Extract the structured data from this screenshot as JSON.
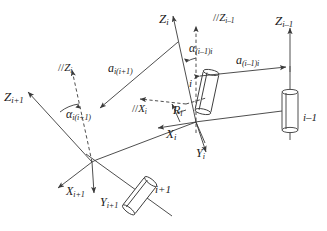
{
  "figure": {
    "kind": "kinematic-link-coordinate-diagram",
    "background_color": "#ffffff",
    "line_color": "#3a3a3a",
    "text_color": "#1a1a1a"
  },
  "axes": [
    {
      "id": "z-i",
      "base": "Z",
      "sub": "i",
      "prefix": "",
      "text": "Zi"
    },
    {
      "id": "z-i-minus-1-parallel",
      "base": "Z",
      "sub": "i-1",
      "prefix": "//",
      "text": "//Zi-1"
    },
    {
      "id": "z-i-minus-1",
      "base": "Z",
      "sub": "i-1",
      "prefix": "",
      "text": "Zi-1"
    },
    {
      "id": "z-i-parallel",
      "base": "Z",
      "sub": "i",
      "prefix": "//",
      "text": "//Zi"
    },
    {
      "id": "z-i-plus-1",
      "base": "Z",
      "sub": "i+1",
      "prefix": "",
      "text": "Zi+1"
    },
    {
      "id": "x-i-parallel",
      "base": "X",
      "sub": "i",
      "prefix": "//",
      "text": "//Xi"
    },
    {
      "id": "x-i",
      "base": "X",
      "sub": "i",
      "prefix": "",
      "text": "Xi"
    },
    {
      "id": "y-i",
      "base": "Y",
      "sub": "i",
      "prefix": "",
      "text": "Yi"
    },
    {
      "id": "x-i-plus-1",
      "base": "X",
      "sub": "i+1",
      "prefix": "",
      "text": "Xi+1"
    },
    {
      "id": "y-i-plus-1",
      "base": "Y",
      "sub": "i+1",
      "prefix": "",
      "text": "Yi+1"
    }
  ],
  "parameters": [
    {
      "id": "alpha-i-minus-1-i",
      "base": "α",
      "sub": "(i-1)i",
      "text": "alpha(i-1)i",
      "meaning": "twist angle between Zi-1 and Zi"
    },
    {
      "id": "alpha-i-i-plus-1",
      "base": "α",
      "sub": "i(i+1)",
      "text": "alpha i(i+1)",
      "meaning": "twist angle between Zi and Zi+1"
    },
    {
      "id": "a-i-minus-1-i",
      "base": "a",
      "sub": "(i-1)i",
      "text": "a(i-1)i",
      "meaning": "link length between Zi-1 and Zi"
    },
    {
      "id": "a-i-i-plus-1",
      "base": "a",
      "sub": "i(i+1)",
      "text": "a i(i+1)",
      "meaning": "link length between Zi and Zi+1"
    },
    {
      "id": "r-i",
      "base": "R",
      "sub": "i",
      "text": "Ri",
      "meaning": "link offset along Zi"
    }
  ],
  "joints": [
    {
      "id": "joint-i-minus-1",
      "label": "i−1",
      "orientation": "vertical"
    },
    {
      "id": "joint-i",
      "label": "i",
      "orientation": "tilted"
    },
    {
      "id": "joint-i-plus-1",
      "label": "i+1",
      "orientation": "tilted"
    }
  ],
  "labels": {
    "z_i": {
      "prefix": "",
      "base": "Z",
      "sub": "i"
    },
    "z_i_minus_1_par": {
      "prefix": "//",
      "base": "Z",
      "sub": "i–1"
    },
    "z_i_minus_1": {
      "prefix": "",
      "base": "Z",
      "sub": "i–1"
    },
    "z_i_par": {
      "prefix": "//",
      "base": "Z",
      "sub": "i"
    },
    "z_i_plus_1": {
      "prefix": "",
      "base": "Z",
      "sub": "i+1"
    },
    "x_i_par": {
      "prefix": "//",
      "base": "X",
      "sub": "i"
    },
    "x_i": {
      "prefix": "",
      "base": "X",
      "sub": "i"
    },
    "y_i": {
      "prefix": "",
      "base": "Y",
      "sub": "i"
    },
    "x_i_plus_1": {
      "prefix": "",
      "base": "X",
      "sub": "i+1"
    },
    "y_i_plus_1": {
      "prefix": "",
      "base": "Y",
      "sub": "i+1"
    },
    "alpha_prev": {
      "prefix": "",
      "base": "α",
      "sub": "(i–1)i"
    },
    "alpha_next": {
      "prefix": "",
      "base": "α",
      "sub": "i(i+1)"
    },
    "a_prev": {
      "prefix": "",
      "base": "a",
      "sub": "(i–1)i"
    },
    "a_next": {
      "prefix": "",
      "base": "a",
      "sub": "i(i+1)"
    },
    "r_i": {
      "prefix": "",
      "base": "R",
      "sub": "i"
    },
    "joint_prev": {
      "text": "i–1"
    },
    "joint_cur": {
      "text": "i"
    },
    "joint_next": {
      "text": "i+1"
    }
  }
}
